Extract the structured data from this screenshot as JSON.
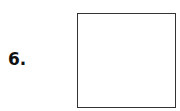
{
  "item": {
    "number_label": "6."
  },
  "answer_box": {
    "value": ""
  }
}
